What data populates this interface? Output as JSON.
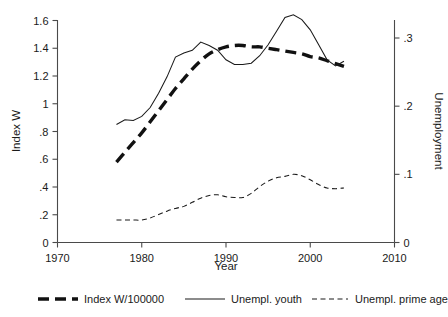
{
  "chart_data": {
    "type": "line",
    "title": "",
    "xlabel": "Year",
    "ylabel": "Index W",
    "y2label": "Unemployment",
    "xlim": [
      1970,
      2010
    ],
    "ylim": [
      0,
      1.6
    ],
    "y2lim": [
      0,
      0.3
    ],
    "grid": false,
    "legend_position": "bottom",
    "xticks": [
      "1970",
      "1980",
      "1990",
      "2000",
      "2010"
    ],
    "xtick_values": [
      1970,
      1980,
      1990,
      2000,
      2010
    ],
    "yticks": [
      "0",
      ".2",
      ".4",
      ".6",
      ".8",
      "1",
      "1.2",
      "1.4",
      "1.6"
    ],
    "ytick_values": [
      0,
      0.2,
      0.4,
      0.6,
      0.8,
      1.0,
      1.2,
      1.4,
      1.6
    ],
    "y2ticks": [
      "0",
      ".1",
      ".2",
      ".3"
    ],
    "y2tick_values": [
      0,
      0.1,
      0.2,
      0.3
    ],
    "series": [
      {
        "name": "Index W/100000",
        "axis": "left",
        "style": "thick-dashed",
        "x": [
          1977,
          1978,
          1979,
          1980,
          1981,
          1982,
          1983,
          1984,
          1985,
          1986,
          1987,
          1988,
          1989,
          1990,
          1991,
          1992,
          1993,
          1994,
          1995,
          1996,
          1997,
          1998,
          1999,
          2000,
          2001,
          2002,
          2003,
          2004
        ],
        "values": [
          0.58,
          0.65,
          0.72,
          0.79,
          0.87,
          0.95,
          1.03,
          1.11,
          1.18,
          1.25,
          1.31,
          1.36,
          1.39,
          1.41,
          1.42,
          1.42,
          1.41,
          1.41,
          1.4,
          1.39,
          1.38,
          1.37,
          1.36,
          1.34,
          1.33,
          1.31,
          1.29,
          1.27
        ]
      },
      {
        "name": "Unempl. youth",
        "axis": "right",
        "style": "thin-solid",
        "x": [
          1977,
          1978,
          1979,
          1980,
          1981,
          1982,
          1983,
          1984,
          1985,
          1986,
          1987,
          1988,
          1989,
          1990,
          1991,
          1992,
          1993,
          1994,
          1995,
          1996,
          1997,
          1998,
          1999,
          2000,
          2001,
          2002,
          2003,
          2004
        ],
        "values": [
          0.173,
          0.18,
          0.179,
          0.185,
          0.198,
          0.219,
          0.243,
          0.272,
          0.278,
          0.282,
          0.294,
          0.289,
          0.282,
          0.268,
          0.261,
          0.261,
          0.263,
          0.274,
          0.29,
          0.31,
          0.33,
          0.334,
          0.327,
          0.312,
          0.29,
          0.268,
          0.259,
          0.266
        ]
      },
      {
        "name": "Unempl. prime age",
        "axis": "right",
        "style": "thin-dashed",
        "x": [
          1977,
          1978,
          1979,
          1980,
          1981,
          1982,
          1983,
          1984,
          1985,
          1986,
          1987,
          1988,
          1989,
          1990,
          1991,
          1992,
          1993,
          1994,
          1995,
          1996,
          1997,
          1998,
          1999,
          2000,
          2001,
          2002,
          2003,
          2004
        ],
        "values": [
          0.033,
          0.033,
          0.033,
          0.033,
          0.036,
          0.041,
          0.046,
          0.05,
          0.053,
          0.059,
          0.065,
          0.069,
          0.07,
          0.067,
          0.066,
          0.066,
          0.072,
          0.082,
          0.09,
          0.095,
          0.097,
          0.1,
          0.098,
          0.092,
          0.085,
          0.08,
          0.079,
          0.08
        ]
      }
    ]
  },
  "legend": {
    "items": [
      {
        "label": "Index W/100000"
      },
      {
        "label": "Unempl. youth"
      },
      {
        "label": "Unempl. prime age"
      }
    ]
  }
}
